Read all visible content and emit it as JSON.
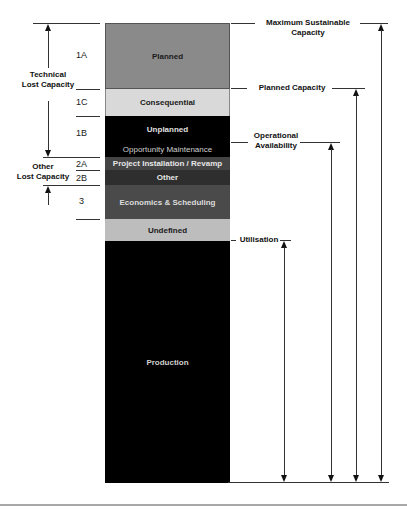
{
  "diagram": {
    "segments": [
      {
        "code": "1A",
        "label": "Planned",
        "color": "#8a8a8a",
        "text_color": "#1a1a1a"
      },
      {
        "code": "1C",
        "label": "Consequential",
        "color": "#d9d9d9",
        "text_color": "#1a1a1a"
      },
      {
        "code": "1B",
        "label": "Unplanned",
        "color": "#000000",
        "text_color": "#e0e0e0"
      },
      {
        "code": "",
        "label": "Opportunity Maintenance",
        "color": "#000000",
        "text_color": "#cfcfcf"
      },
      {
        "code": "2A",
        "label": "Project Installation / Revamp",
        "color": "#444444",
        "text_color": "#e6e6e6"
      },
      {
        "code": "2B",
        "label": "Other",
        "color": "#2e2e2e",
        "text_color": "#e6e6e6"
      },
      {
        "code": "3",
        "label": "Economics & Scheduling",
        "color": "#4a4a4a",
        "text_color": "#dddddd"
      },
      {
        "code": "",
        "label": "Undefined",
        "color": "#bdbdbd",
        "text_color": "#1a1a1a"
      },
      {
        "code": "",
        "label": "Production",
        "color": "#000000",
        "text_color": "#d0d0d0"
      }
    ],
    "left_groups": {
      "technical": "Technical\nLost Capacity",
      "other": "Other\nLost Capacity"
    },
    "right_levels": [
      {
        "label": "Maximum Sustainable\nCapacity"
      },
      {
        "label": "Planned Capacity"
      },
      {
        "label": "Operational\nAvailability"
      },
      {
        "label": "Utilisation"
      }
    ]
  }
}
